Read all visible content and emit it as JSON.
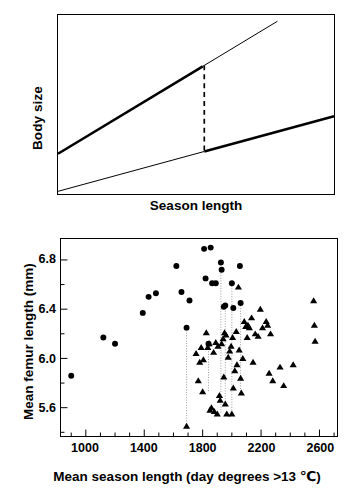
{
  "figure": {
    "panels": [
      {
        "id": "schematic",
        "position": "top"
      },
      {
        "id": "scatter",
        "position": "bottom"
      }
    ]
  },
  "top_panel": {
    "ylabel": "Body size",
    "xlabel": "Season length",
    "description": "Schematic of two reaction-norm lines of body size against season length; a vertical dashed line marks the divergence point between them.",
    "lines": [
      {
        "name": "steep-line",
        "style": "thick-then-thin",
        "break_fraction": 0.66
      },
      {
        "name": "shallow-line",
        "style": "thin-then-thick",
        "break_fraction": 0.53
      }
    ],
    "connector": {
      "name": "dashed-connector",
      "style": "dashed"
    }
  },
  "scatter_panel": {
    "ylabel": "Mean femur length (mm)",
    "xlabel": "Mean season length (day degrees >13 ℃)",
    "x_ticks": [
      1000,
      1400,
      1800,
      2200,
      2600
    ],
    "x_tick_labels": [
      "1000",
      "1400",
      "1800",
      "2200",
      "2600"
    ],
    "y_ticks": [
      5.6,
      6.0,
      6.4,
      6.8
    ],
    "y_tick_labels": [
      "5.6",
      "6.0",
      "6.4",
      "6.8"
    ]
  },
  "chart_data": {
    "type": "scatter",
    "title": "",
    "xlabel": "Mean season length (day degrees >13 ℃)",
    "ylabel": "Mean femur length (mm)",
    "xlim": [
      830,
      2720
    ],
    "ylim": [
      5.37,
      6.97
    ],
    "xticks": [
      1000,
      1400,
      1800,
      2200,
      2600
    ],
    "yticks": [
      5.6,
      6.0,
      6.4,
      6.8
    ],
    "minor_x_step": 100,
    "minor_y_step": 0.2,
    "grid": false,
    "legend": null,
    "series": [
      {
        "name": "circle-population",
        "marker": "circle",
        "points": [
          [
            900,
            5.86
          ],
          [
            1120,
            6.17
          ],
          [
            1200,
            6.12
          ],
          [
            1390,
            6.37
          ],
          [
            1430,
            6.5
          ],
          [
            1480,
            6.53
          ],
          [
            1620,
            6.75
          ],
          [
            1655,
            6.54
          ],
          [
            1690,
            6.25
          ],
          [
            1710,
            6.47
          ],
          [
            1810,
            6.89
          ],
          [
            1820,
            6.65
          ],
          [
            1840,
            6.12
          ],
          [
            1855,
            6.9
          ],
          [
            1865,
            6.61
          ],
          [
            1890,
            6.61
          ],
          [
            1925,
            6.78
          ],
          [
            1930,
            6.72
          ],
          [
            1945,
            6.42
          ],
          [
            1955,
            6.43
          ],
          [
            2000,
            6.61
          ],
          [
            2010,
            6.41
          ],
          [
            2055,
            6.75
          ],
          [
            2060,
            6.45
          ]
        ]
      },
      {
        "name": "triangle-population",
        "marker": "triangle",
        "points": [
          [
            1690,
            5.45
          ],
          [
            1755,
            6.04
          ],
          [
            1770,
            5.82
          ],
          [
            1780,
            5.97
          ],
          [
            1790,
            6.09
          ],
          [
            1800,
            5.73
          ],
          [
            1805,
            5.99
          ],
          [
            1825,
            6.21
          ],
          [
            1835,
            6.09
          ],
          [
            1845,
            6.12
          ],
          [
            1850,
            5.58
          ],
          [
            1860,
            5.6
          ],
          [
            1875,
            6.05
          ],
          [
            1880,
            5.57
          ],
          [
            1890,
            6.13
          ],
          [
            1900,
            5.55
          ],
          [
            1905,
            6.1
          ],
          [
            1915,
            5.7
          ],
          [
            1920,
            5.66
          ],
          [
            1930,
            6.12
          ],
          [
            1940,
            6.16
          ],
          [
            1945,
            5.85
          ],
          [
            1950,
            6.21
          ],
          [
            1955,
            5.63
          ],
          [
            1960,
            6.19
          ],
          [
            1965,
            5.55
          ],
          [
            1975,
            6.01
          ],
          [
            1985,
            6.06
          ],
          [
            1995,
            6.1
          ],
          [
            2000,
            5.55
          ],
          [
            2005,
            6.17
          ],
          [
            2010,
            5.76
          ],
          [
            2020,
            5.9
          ],
          [
            2030,
            6.22
          ],
          [
            2035,
            5.95
          ],
          [
            2045,
            6.58
          ],
          [
            2050,
            6.07
          ],
          [
            2060,
            5.84
          ],
          [
            2065,
            5.72
          ],
          [
            2075,
            6.0
          ],
          [
            2085,
            6.3
          ],
          [
            2095,
            6.26
          ],
          [
            2105,
            6.17
          ],
          [
            2110,
            6.27
          ],
          [
            2120,
            6.25
          ],
          [
            2135,
            6.33
          ],
          [
            2145,
            5.97
          ],
          [
            2160,
            6.2
          ],
          [
            2180,
            6.18
          ],
          [
            2195,
            6.4
          ],
          [
            2210,
            6.25
          ],
          [
            2235,
            6.3
          ],
          [
            2245,
            6.27
          ],
          [
            2255,
            5.88
          ],
          [
            2265,
            6.2
          ],
          [
            2280,
            5.82
          ],
          [
            2330,
            5.93
          ],
          [
            2355,
            5.78
          ],
          [
            2420,
            5.95
          ],
          [
            2560,
            6.47
          ],
          [
            2565,
            6.27
          ],
          [
            2570,
            6.14
          ]
        ]
      }
    ],
    "connectors": [
      {
        "x": 1690,
        "y1": 6.25,
        "y2": 5.45
      },
      {
        "x": 1840,
        "y1": 6.12,
        "y2": 5.73
      },
      {
        "x": 1925,
        "y1": 6.78,
        "y2": 5.55
      },
      {
        "x": 1955,
        "y1": 6.43,
        "y2": 5.63
      },
      {
        "x": 2000,
        "y1": 6.61,
        "y2": 5.55
      },
      {
        "x": 2060,
        "y1": 6.45,
        "y2": 5.72
      }
    ]
  }
}
